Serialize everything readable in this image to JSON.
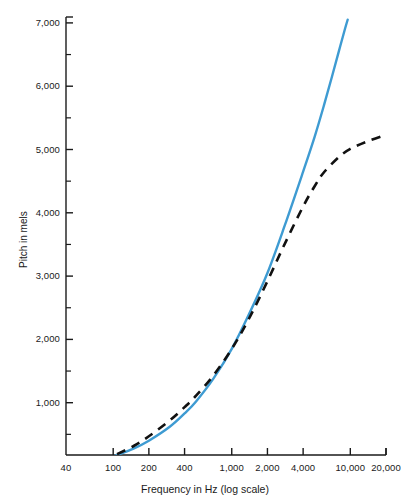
{
  "chart_data": {
    "type": "line",
    "title": "",
    "xlabel": "Frequency in Hz (log scale)",
    "ylabel": "Pitch in mels",
    "xscale": "log",
    "xlim": [
      40,
      20000
    ],
    "ylim": [
      0,
      7000
    ],
    "grid": false,
    "legend": "none",
    "x_tick_labels": [
      "40",
      "100",
      "200",
      "400",
      "1,000",
      "2,000",
      "4,000",
      "10,000",
      "20,000"
    ],
    "x_tick_values": [
      40,
      100,
      200,
      400,
      1000,
      2000,
      4000,
      10000,
      20000
    ],
    "y_tick_labels": [
      "1,000",
      "2,000",
      "3,000",
      "4,000",
      "5,000",
      "6,000",
      "7,000"
    ],
    "y_tick_values": [
      1000,
      2000,
      3000,
      4000,
      5000,
      6000,
      7000
    ],
    "y_minor_tick_values": [
      500,
      1500,
      2500,
      3500,
      4500,
      5500,
      6500
    ],
    "series": [
      {
        "name": "linear-frequency pitch curve",
        "style": "solid",
        "color": "#3E9BD2",
        "width": 2.4,
        "points": [
          [
            40,
            0
          ],
          [
            60,
            45
          ],
          [
            80,
            95
          ],
          [
            100,
            150
          ],
          [
            150,
            280
          ],
          [
            200,
            400
          ],
          [
            300,
            620
          ],
          [
            400,
            830
          ],
          [
            500,
            1020
          ],
          [
            700,
            1380
          ],
          [
            1000,
            1850
          ],
          [
            1400,
            2400
          ],
          [
            2000,
            3050
          ],
          [
            2800,
            3800
          ],
          [
            4000,
            4650
          ],
          [
            5000,
            5200
          ],
          [
            6000,
            5700
          ],
          [
            7000,
            6150
          ],
          [
            8000,
            6550
          ],
          [
            9000,
            6900
          ],
          [
            9500,
            7050
          ]
        ]
      },
      {
        "name": "mel-scale pitch curve",
        "style": "dashed",
        "color": "#111111",
        "width": 2.6,
        "dash": "9,7",
        "points": [
          [
            60,
            25
          ],
          [
            80,
            90
          ],
          [
            100,
            160
          ],
          [
            150,
            320
          ],
          [
            200,
            470
          ],
          [
            300,
            720
          ],
          [
            400,
            930
          ],
          [
            500,
            1110
          ],
          [
            700,
            1430
          ],
          [
            1000,
            1850
          ],
          [
            1400,
            2330
          ],
          [
            2000,
            2920
          ],
          [
            2800,
            3510
          ],
          [
            4000,
            4100
          ],
          [
            5000,
            4420
          ],
          [
            6000,
            4640
          ],
          [
            8000,
            4880
          ],
          [
            10000,
            5010
          ],
          [
            14000,
            5130
          ],
          [
            20000,
            5230
          ]
        ]
      }
    ]
  },
  "axes": {
    "x_title": "Frequency in Hz (log scale)",
    "y_title": "Pitch in mels"
  }
}
